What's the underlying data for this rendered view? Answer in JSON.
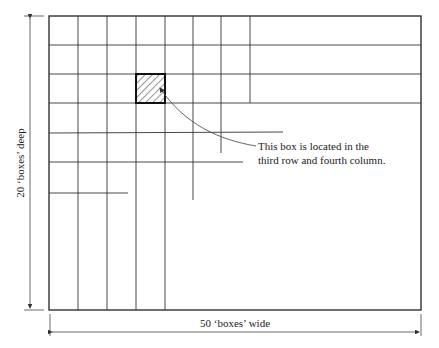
{
  "diagram": {
    "grid": {
      "outer": {
        "left": 49,
        "top": 16,
        "right": 421,
        "bottom": 310
      },
      "row_lines": [
        {
          "y": 45,
          "x_end": 421
        },
        {
          "y": 74,
          "x_end": 421
        },
        {
          "y": 103,
          "x_end": 421
        },
        {
          "y": 133,
          "x_end": 283
        },
        {
          "y": 162,
          "x_end": 243
        },
        {
          "y": 193,
          "x_end": 128
        }
      ],
      "col_lines": [
        {
          "x": 78,
          "y_end": 310
        },
        {
          "x": 107,
          "y_end": 310
        },
        {
          "x": 136,
          "y_end": 310
        },
        {
          "x": 165,
          "y_end": 310
        },
        {
          "x": 193,
          "y_end": 200
        },
        {
          "x": 221,
          "y_end": 153
        },
        {
          "x": 250,
          "y_end": 103
        }
      ],
      "highlighted_cell": {
        "row": 3,
        "column": 4,
        "x": 136,
        "y": 74,
        "w": 29,
        "h": 29,
        "pattern": "diagonal-hatch"
      }
    },
    "annotation": {
      "line1": "This box is located in the",
      "line2": "third row and fourth column."
    },
    "dimensions": {
      "height_label": "20 ‘boxes’ deep",
      "width_label": "50 ‘boxes’ wide"
    },
    "colors": {
      "line": "#222222",
      "leader": "#555555",
      "background": "#ffffff"
    }
  }
}
